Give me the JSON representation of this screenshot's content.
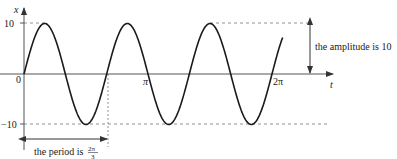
{
  "diagram": {
    "axes": {
      "x_label": "t",
      "y_label": "x",
      "y_ticks": [
        {
          "label": "10",
          "value": 10
        },
        {
          "label": "0",
          "value": 0
        },
        {
          "label": "−10",
          "value": -10
        }
      ],
      "x_ticks": [
        {
          "label": "π",
          "value": "pi"
        },
        {
          "label": "2π",
          "value": "2pi"
        }
      ]
    },
    "curve": {
      "function": "x = 10 sin(3t)",
      "amplitude": 10,
      "period": "2π/3",
      "t_range": [
        0,
        "slightly beyond 2π"
      ]
    },
    "annotations": {
      "amplitude_label": "the amplitude is 10",
      "period_label_prefix": "the period is",
      "period_numerator": "2π",
      "period_denominator": "3"
    },
    "colors": {
      "curve": "#1a1a1a",
      "axis": "#555555",
      "dashed": "#777777"
    }
  }
}
